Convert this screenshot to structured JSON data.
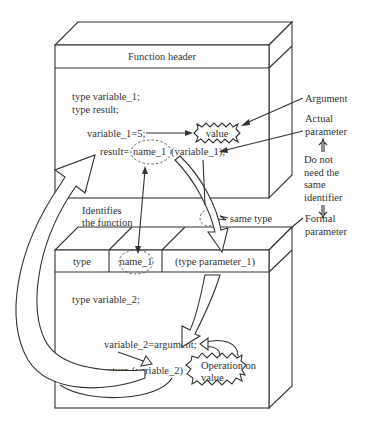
{
  "diagram": {
    "type": "function-call-parameter-passing",
    "caller_box": {
      "header": "Function header",
      "lines": [
        "type variable_1;",
        "type result;",
        "variable_1=5;",
        "result=",
        "name_1",
        "(variable_1);"
      ],
      "value_burst": "value"
    },
    "callee_box": {
      "header_cells": [
        "type",
        "name_1",
        "(type parameter_1)"
      ],
      "lines": [
        "type variable_2;",
        "variable_2=argument;",
        "return (variable_2)"
      ],
      "operation_burst": [
        "Operation on",
        "value"
      ]
    },
    "annotations": {
      "argument": "Argument",
      "actual_parameter": [
        "Actual",
        "parameter"
      ],
      "do_not_need": [
        "Do not",
        "need the",
        "same",
        "identifier"
      ],
      "formal_parameter": [
        "Formal",
        "parameter"
      ],
      "identifies_function": [
        "Identifies",
        "the function"
      ],
      "same_type": "same type"
    },
    "colors": {
      "line": "#333333",
      "background": "#ffffff",
      "dashed": "#555555"
    }
  }
}
